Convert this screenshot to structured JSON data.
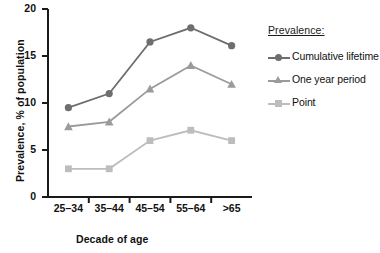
{
  "chart_data": {
    "type": "line",
    "title": "",
    "xlabel": "Decade of age",
    "ylabel": "Prevalence, % of population",
    "categories": [
      "25–34",
      "35–44",
      "45–54",
      "55–64",
      ">65"
    ],
    "ylim": [
      0,
      20
    ],
    "yticks": [
      0,
      5,
      10,
      15,
      20
    ],
    "ytick_labels": [
      "0",
      "5",
      "10",
      "15",
      "20"
    ],
    "grid": false,
    "legend_position": "right",
    "legend_title": "Prevalence:",
    "series": [
      {
        "name": "Cumulative lifetime",
        "marker": "circle",
        "color": "#6e6e6e",
        "values": [
          9.5,
          11.0,
          16.5,
          18.0,
          16.1
        ]
      },
      {
        "name": "One year period",
        "marker": "triangle",
        "color": "#9b9b9b",
        "values": [
          7.5,
          8.0,
          11.5,
          14.0,
          12.0
        ]
      },
      {
        "name": "Point",
        "marker": "square",
        "color": "#bdbdbd",
        "values": [
          3.0,
          3.0,
          6.0,
          7.1,
          6.0
        ]
      }
    ]
  },
  "axis": {
    "line_color": "#1a1a1a"
  }
}
